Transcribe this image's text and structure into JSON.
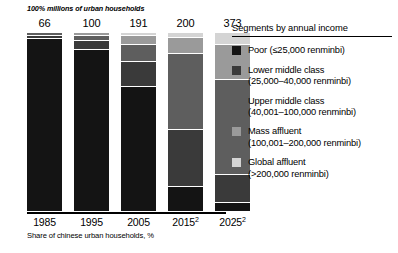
{
  "chart_data": {
    "type": "bar",
    "title": "",
    "subtitle": "100% millions of urban households",
    "footnote": "Share of chinese urban households, %",
    "xlabel": "",
    "ylabel": "",
    "ylim": [
      0,
      100
    ],
    "grid": false,
    "stacked": true,
    "legend_position": "right",
    "legend_title": "Segments by annual income",
    "categories": [
      "1985",
      "1995",
      "2005",
      "2015",
      "2025"
    ],
    "category_superscripts": [
      "",
      "",
      "",
      "2",
      "2"
    ],
    "totals_label": "millions of urban households",
    "totals": [
      66,
      100,
      191,
      200,
      373
    ],
    "series": [
      {
        "name": "Global affluent",
        "range": "(>200,000 renminbi)",
        "color": "#d4d4d4",
        "values": [
          0,
          0,
          1,
          2,
          6
        ]
      },
      {
        "name": "Mass affluent",
        "range": "(100,001–200,000 renminbi)",
        "color": "#9a9a9a",
        "values": [
          0,
          1,
          5,
          9,
          20
        ]
      },
      {
        "name": "Upper middle class",
        "range": "(40,001–100,000 renminbi)",
        "color": "#5e5e5e",
        "values": [
          1,
          3,
          10,
          43,
          53
        ]
      },
      {
        "name": "Lower middle class",
        "range": "(25,000–40,000 renminbi)",
        "color": "#3a3a3a",
        "values": [
          2,
          5,
          14,
          32,
          16
        ]
      },
      {
        "name": "Poor",
        "range": "(≤25,000 renminbi)",
        "color": "#141414",
        "values": [
          97,
          91,
          70,
          14,
          5
        ]
      }
    ]
  }
}
